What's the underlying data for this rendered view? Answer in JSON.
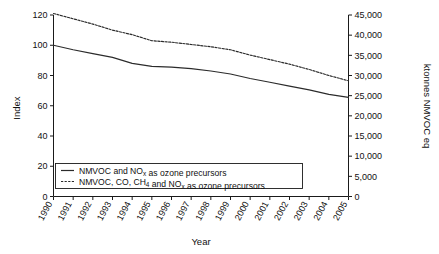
{
  "chart_data": {
    "type": "line",
    "title": "",
    "xlabel": "Year",
    "ylabel": "Index",
    "ylabel_right": "ktonnes NMVOC eq",
    "categories": [
      "1990",
      "1991",
      "1992",
      "1993",
      "1994",
      "1995",
      "1996",
      "1997",
      "1998",
      "1999",
      "2000",
      "2001",
      "2002",
      "2003",
      "2004",
      "2005"
    ],
    "ylim": [
      0,
      120
    ],
    "yticks": [
      0,
      20,
      40,
      60,
      80,
      100,
      120
    ],
    "ylim_right": [
      0,
      45000
    ],
    "yticks_right": [
      "0",
      "5,000",
      "10,000",
      "15,000",
      "20,000",
      "25,000",
      "30,000",
      "35,000",
      "40,000",
      "45,000"
    ],
    "grid": false,
    "legend_position": "lower-center-inside",
    "series": [
      {
        "name": "NMVOC and NOx as ozone precursors",
        "style": "solid",
        "values": [
          100,
          97,
          94.5,
          92,
          88,
          86,
          85.5,
          84.5,
          83,
          81,
          78,
          75.5,
          73,
          70.5,
          67.5,
          65.5
        ]
      },
      {
        "name": "NMVOC, CO, CH4 and NOx as ozone precursors",
        "style": "dashed",
        "values": [
          121,
          117.5,
          114,
          110,
          107,
          103,
          102,
          100.5,
          99,
          97,
          93.5,
          90.5,
          87.5,
          84,
          80,
          76.5
        ]
      }
    ]
  },
  "legend": {
    "items": [
      {
        "marker": "solid-line-swatch",
        "text_parts": [
          {
            "t": "NMVOC and NO",
            "sub": false
          },
          {
            "t": "x",
            "sub": true
          },
          {
            "t": " as ozone precursors",
            "sub": false
          }
        ],
        "plain": "NMVOC and NOx as ozone precursors"
      },
      {
        "marker": "dashed-line-swatch",
        "text_parts": [
          {
            "t": "NMVOC, CO, CH",
            "sub": false
          },
          {
            "t": "4",
            "sub": true
          },
          {
            "t": " and NO",
            "sub": false
          },
          {
            "t": "x",
            "sub": true
          },
          {
            "t": " as ozone precursors",
            "sub": false
          }
        ],
        "plain": "NMVOC, CO, CH4 and NOx as ozone precursors"
      }
    ]
  },
  "axes": {
    "left_title": "Index",
    "right_title": "ktonnes NMVOC eq",
    "bottom_title": "Year"
  },
  "colors": {
    "line": "#2b2b2b",
    "axis": "#1a1a1a",
    "text": "#111111",
    "background": "#ffffff"
  }
}
